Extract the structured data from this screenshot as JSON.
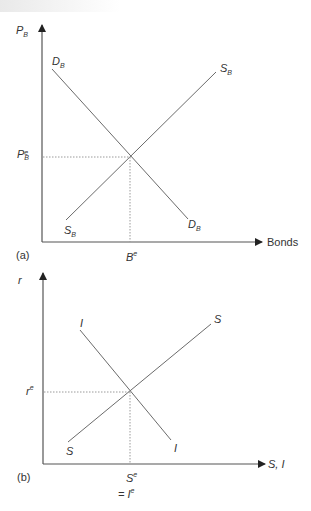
{
  "panel_a": {
    "panel_label": "(a)",
    "y_axis": {
      "symbol": "P",
      "subscript": "B"
    },
    "x_axis": {
      "label": "Bonds"
    },
    "demand_curve": {
      "symbol": "D",
      "subscript": "B"
    },
    "supply_curve": {
      "symbol": "S",
      "subscript": "B"
    },
    "equilibrium_price": {
      "symbol": "P",
      "superscript": "e",
      "subscript": "B"
    },
    "equilibrium_quantity": {
      "symbol": "B",
      "superscript": "e"
    }
  },
  "panel_b": {
    "panel_label": "(b)",
    "y_axis": {
      "symbol": "r"
    },
    "x_axis": {
      "label": "S, I"
    },
    "investment_curve": {
      "symbol": "I"
    },
    "saving_curve": {
      "symbol": "S"
    },
    "equilibrium_rate": {
      "symbol": "r",
      "superscript": "e"
    },
    "equilibrium_quantity": {
      "symbol": "S",
      "superscript": "e",
      "line2": "= I",
      "line2_superscript": "e"
    }
  },
  "colors": {
    "axis": "#333333",
    "curve": "#6b6b6b",
    "guide": "#9a9a9a"
  }
}
